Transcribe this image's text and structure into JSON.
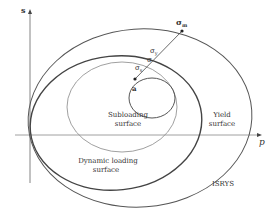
{
  "diagram": {
    "axes": {
      "x_label": "p",
      "y_label": "s"
    },
    "surfaces": [
      {
        "label": "ISRYS",
        "type": "outer-ellipse"
      },
      {
        "label_line1": "Yield",
        "label_line2": "surface",
        "type": "ellipse"
      },
      {
        "label_line1": "Dynamic loading",
        "label_line2": "surface",
        "type": "ellipse"
      },
      {
        "label_line1": "Subloading",
        "label_line2": "surface",
        "type": "ellipse"
      }
    ],
    "points": {
      "center": "a",
      "sigma_m": "σ",
      "sigma_m_sub": "m",
      "sigma_y": "σ",
      "sigma_y_sub": "y",
      "sigma": "σ",
      "sigma_s": "σ",
      "sigma_s_sub": "s"
    }
  }
}
